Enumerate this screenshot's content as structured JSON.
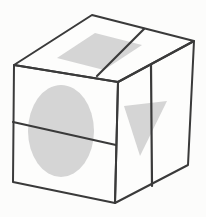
{
  "figure": {
    "name": "cube-with-shaded-shapes-diagram",
    "background_color": "#fcfcfb",
    "line_color": "#3a3a3a",
    "face_fill_color": "#fdfdfc",
    "shape_fill_color": "#d5d5d5",
    "cube": {
      "faces": {
        "top_path": "M14,65 L92,15 L194,41 L118,82 Z",
        "front_path": "M14,65 L118,82 L115,203 L13,182 Z",
        "right_path": "M118,82 L194,41 L188,165 L115,203 Z"
      },
      "dividers": {
        "top_line_path": "M97,76 L144,29",
        "front_line_path": "M13,122 L116,145",
        "right_line_path": "M151,65 L152,186"
      }
    },
    "shapes": {
      "top_parallelogram": {
        "type": "parallelogram",
        "path": "M57,58 L95,33 L142,45 L104,70 Z"
      },
      "front_ellipse": {
        "type": "ellipse",
        "cx": "61",
        "cy": "131",
        "rx": "33",
        "ry": "46"
      },
      "right_triangle": {
        "type": "triangle",
        "path": "M124,106 L167,101 L140,156 Z"
      }
    }
  }
}
